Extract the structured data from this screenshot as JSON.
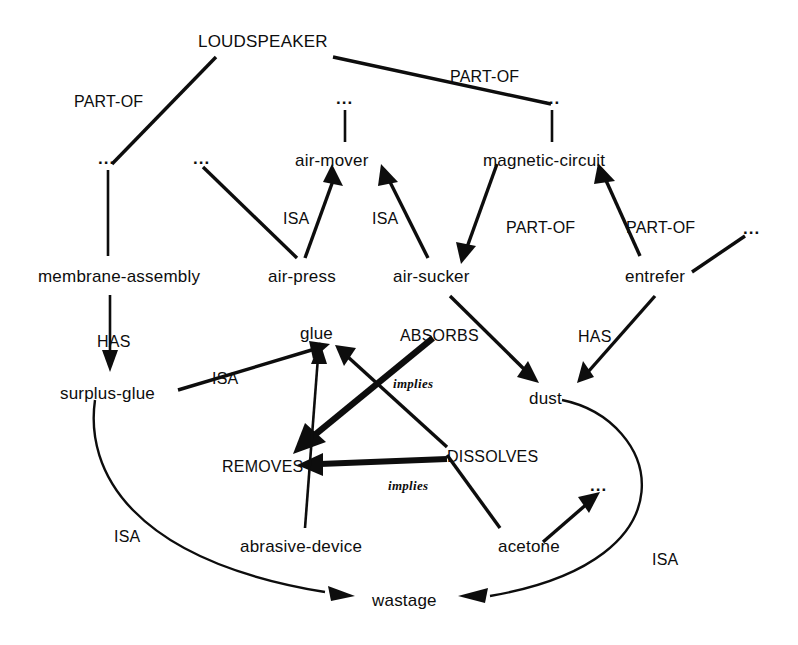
{
  "diagram": {
    "type": "semantic-network",
    "ink_color": "#0d0d0d",
    "background_color": "#ffffff",
    "ellipsis_glyph": "...",
    "nodes": [
      {
        "id": "loudspeaker",
        "label": "LOUDSPEAKER",
        "x": 198,
        "y": 33,
        "kind": "concept-upper"
      },
      {
        "id": "ellipsis-left",
        "label": "...",
        "x": 98,
        "y": 158,
        "kind": "ellipsis"
      },
      {
        "id": "ellipsis-airpress",
        "label": "...",
        "x": 193,
        "y": 158,
        "kind": "ellipsis"
      },
      {
        "id": "ellipsis-airmover",
        "label": "...",
        "x": 336,
        "y": 98,
        "kind": "ellipsis"
      },
      {
        "id": "ellipsis-magnetic",
        "label": "...",
        "x": 543,
        "y": 98,
        "kind": "ellipsis"
      },
      {
        "id": "ellipsis-entrefer",
        "label": "...",
        "x": 745,
        "y": 228,
        "kind": "ellipsis"
      },
      {
        "id": "ellipsis-acetone",
        "label": "...",
        "x": 595,
        "y": 483,
        "kind": "ellipsis"
      },
      {
        "id": "air-mover",
        "label": "air-mover",
        "x": 295,
        "y": 152,
        "kind": "concept"
      },
      {
        "id": "magnetic-circuit",
        "label": "magnetic-circuit",
        "x": 483,
        "y": 152,
        "kind": "concept"
      },
      {
        "id": "membrane-assembly",
        "label": "membrane-assembly",
        "x": 38,
        "y": 268,
        "kind": "concept"
      },
      {
        "id": "air-press",
        "label": "air-press",
        "x": 268,
        "y": 268,
        "kind": "concept"
      },
      {
        "id": "air-sucker",
        "label": "air-sucker",
        "x": 393,
        "y": 268,
        "kind": "concept"
      },
      {
        "id": "entrefer",
        "label": "entrefer",
        "x": 625,
        "y": 268,
        "kind": "concept"
      },
      {
        "id": "glue",
        "label": "glue",
        "x": 300,
        "y": 325,
        "kind": "concept"
      },
      {
        "id": "dust",
        "label": "dust",
        "x": 529,
        "y": 390,
        "kind": "concept"
      },
      {
        "id": "surplus-glue",
        "label": "surplus-glue",
        "x": 60,
        "y": 385,
        "kind": "concept"
      },
      {
        "id": "abrasive-device",
        "label": "abrasive-device",
        "x": 240,
        "y": 538,
        "kind": "concept"
      },
      {
        "id": "acetone",
        "label": "acetone",
        "x": 498,
        "y": 538,
        "kind": "concept"
      },
      {
        "id": "wastage",
        "label": "wastage",
        "x": 372,
        "y": 592,
        "kind": "concept"
      }
    ],
    "relation_labels": [
      {
        "id": "part-of-membrane",
        "label": "PART-OF",
        "x": 74,
        "y": 94
      },
      {
        "id": "part-of-magnetic",
        "label": "PART-OF",
        "x": 450,
        "y": 69
      },
      {
        "id": "isa-air-press",
        "label": "ISA",
        "x": 283,
        "y": 211
      },
      {
        "id": "isa-air-sucker",
        "label": "ISA",
        "x": 372,
        "y": 211
      },
      {
        "id": "part-of-sucker",
        "label": "PART-OF",
        "x": 506,
        "y": 220
      },
      {
        "id": "part-of-entrefer",
        "label": "PART-OF",
        "x": 626,
        "y": 220
      },
      {
        "id": "has-surplus-glue",
        "label": "HAS",
        "x": 97,
        "y": 334
      },
      {
        "id": "isa-surplus-glue",
        "label": "ISA",
        "x": 212,
        "y": 371
      },
      {
        "id": "absorbs",
        "label": "ABSORBS",
        "x": 400,
        "y": 328
      },
      {
        "id": "has-dust",
        "label": "HAS",
        "x": 578,
        "y": 329
      },
      {
        "id": "removes",
        "label": "REMOVES",
        "x": 222,
        "y": 459
      },
      {
        "id": "dissolves",
        "label": "DISSOLVES",
        "x": 447,
        "y": 449
      },
      {
        "id": "isa-wastage-left",
        "label": "ISA",
        "x": 114,
        "y": 529
      },
      {
        "id": "isa-wastage-right",
        "label": "ISA",
        "x": 652,
        "y": 552
      },
      {
        "id": "implies-absorbs",
        "label": "implies",
        "x": 393,
        "y": 377
      },
      {
        "id": "implies-dissolves",
        "label": "implies",
        "x": 388,
        "y": 479
      }
    ],
    "edges": [
      {
        "id": "loudspeaker-to-ellipsis-left",
        "from": "loudspeaker",
        "to": "ellipsis-left",
        "relation": "PART-OF",
        "arrow": "none",
        "weight": "med"
      },
      {
        "id": "ellipsis-left-to-membrane",
        "from": "ellipsis-left",
        "to": "membrane-assembly",
        "relation": "PART-OF",
        "arrow": "none",
        "weight": "thin"
      },
      {
        "id": "loudspeaker-to-ellipsis-magnetic",
        "from": "loudspeaker",
        "to": "ellipsis-magnetic",
        "relation": "PART-OF",
        "arrow": "none",
        "weight": "med"
      },
      {
        "id": "ellipsis-magnetic-to-magnetic",
        "from": "ellipsis-magnetic",
        "to": "magnetic-circuit",
        "relation": "PART-OF",
        "arrow": "none",
        "weight": "thin"
      },
      {
        "id": "ellipsis-airmover-to-airmover",
        "from": "ellipsis-airmover",
        "to": "air-mover",
        "relation": "",
        "arrow": "none",
        "weight": "thin"
      },
      {
        "id": "ellipsis-airpress-to-airpress",
        "from": "ellipsis-airpress",
        "to": "air-press",
        "relation": "",
        "arrow": "none",
        "weight": "med"
      },
      {
        "id": "air-press-to-air-mover",
        "from": "air-press",
        "to": "air-mover",
        "relation": "ISA",
        "arrow": "end",
        "weight": "med"
      },
      {
        "id": "air-sucker-to-air-mover",
        "from": "air-sucker",
        "to": "air-mover",
        "relation": "ISA",
        "arrow": "end",
        "weight": "med"
      },
      {
        "id": "magnetic-to-air-sucker",
        "from": "magnetic-circuit",
        "to": "air-sucker",
        "relation": "PART-OF",
        "arrow": "end",
        "weight": "med"
      },
      {
        "id": "entrefer-to-magnetic",
        "from": "entrefer",
        "to": "magnetic-circuit",
        "relation": "PART-OF",
        "arrow": "end",
        "weight": "med"
      },
      {
        "id": "ellipsis-entrefer-to-entrefer",
        "from": "ellipsis-entrefer",
        "to": "entrefer",
        "relation": "",
        "arrow": "none",
        "weight": "med"
      },
      {
        "id": "membrane-to-surplus-glue",
        "from": "membrane-assembly",
        "to": "surplus-glue",
        "relation": "HAS",
        "arrow": "end",
        "weight": "thin"
      },
      {
        "id": "surplus-glue-to-glue",
        "from": "surplus-glue",
        "to": "glue",
        "relation": "ISA",
        "arrow": "end",
        "weight": "med"
      },
      {
        "id": "air-sucker-to-dust",
        "from": "air-sucker",
        "to": "dust",
        "relation": "ABSORBS",
        "arrow": "end",
        "weight": "med"
      },
      {
        "id": "entrefer-to-dust",
        "from": "entrefer",
        "to": "dust",
        "relation": "HAS",
        "arrow": "end",
        "weight": "med"
      },
      {
        "id": "absorbs-implies-removes",
        "from": "absorbs",
        "to": "removes",
        "relation": "implies",
        "arrow": "end",
        "weight": "thick"
      },
      {
        "id": "dissolves-implies-removes",
        "from": "dissolves",
        "to": "removes",
        "relation": "implies",
        "arrow": "end",
        "weight": "thick"
      },
      {
        "id": "abrasive-device-to-glue",
        "from": "abrasive-device",
        "to": "glue",
        "relation": "REMOVES",
        "arrow": "end",
        "weight": "thin"
      },
      {
        "id": "dissolves-to-glue",
        "from": "dissolves",
        "to": "glue",
        "relation": "DISSOLVES",
        "arrow": "end",
        "weight": "med"
      },
      {
        "id": "acetone-to-dissolves",
        "from": "acetone",
        "to": "dissolves",
        "relation": "DISSOLVES",
        "arrow": "none",
        "weight": "med"
      },
      {
        "id": "acetone-to-ellipsis",
        "from": "acetone",
        "to": "ellipsis-acetone",
        "relation": "",
        "arrow": "end",
        "weight": "med"
      },
      {
        "id": "surplus-glue-to-wastage",
        "from": "surplus-glue",
        "to": "wastage",
        "relation": "ISA",
        "arrow": "end",
        "weight": "curve"
      },
      {
        "id": "dust-to-wastage",
        "from": "dust",
        "to": "wastage",
        "relation": "ISA",
        "arrow": "end",
        "weight": "curve"
      }
    ]
  }
}
